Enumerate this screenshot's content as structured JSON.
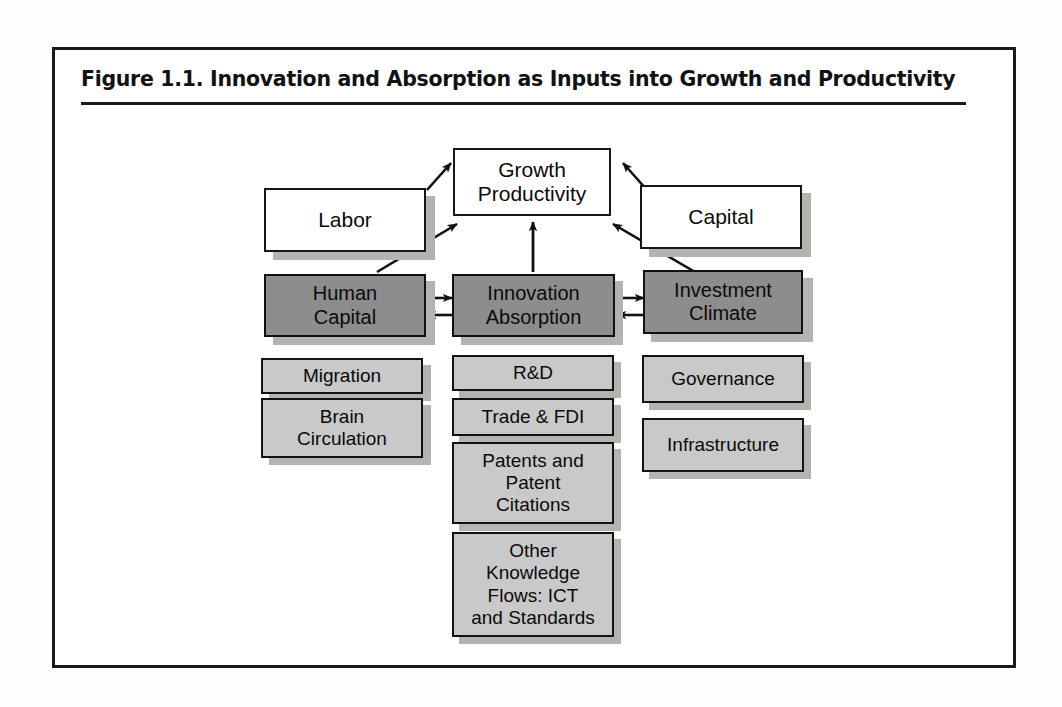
{
  "figure": {
    "title": "Figure 1.1.  Innovation and Absorption as Inputs into Growth and Productivity",
    "colors": {
      "frame_border": "#1a1a1a",
      "white_box_fill": "#ffffff",
      "dark_box_fill": "#8d8d8d",
      "light_box_fill": "#c9c9c9",
      "shadow": "#b4b3b0",
      "text": "#0a0a0a"
    }
  },
  "diagram": {
    "type": "flow-diagram",
    "top_nodes": [
      {
        "id": "labor",
        "label": "Labor",
        "style": "white"
      },
      {
        "id": "growth-productivity",
        "label": "Growth\nProductivity",
        "style": "white"
      },
      {
        "id": "capital",
        "label": "Capital",
        "style": "white"
      }
    ],
    "middle_nodes": [
      {
        "id": "human-capital",
        "label": "Human\nCapital",
        "style": "dark"
      },
      {
        "id": "innovation-absorption",
        "label": "Innovation\nAbsorption",
        "style": "dark"
      },
      {
        "id": "investment-climate",
        "label": "Investment\nClimate",
        "style": "dark"
      }
    ],
    "columns": [
      {
        "id": "human-capital-indicators",
        "items": [
          {
            "id": "migration",
            "label": "Migration",
            "style": "light"
          },
          {
            "id": "brain-circulation",
            "label": "Brain\nCirculation",
            "style": "light"
          }
        ]
      },
      {
        "id": "innovation-absorption-indicators",
        "items": [
          {
            "id": "rd",
            "label": "R&D",
            "style": "light"
          },
          {
            "id": "trade-fdi",
            "label": "Trade & FDI",
            "style": "light"
          },
          {
            "id": "patents-and-patent-citations",
            "label": "Patents and\nPatent\nCitations",
            "style": "light"
          },
          {
            "id": "other-knowledge-flows",
            "label": "Other\nKnowledge\nFlows: ICT\nand Standards",
            "style": "light"
          }
        ]
      },
      {
        "id": "investment-climate-indicators",
        "items": [
          {
            "id": "governance",
            "label": "Governance",
            "style": "light"
          },
          {
            "id": "infrastructure",
            "label": "Infrastructure",
            "style": "light"
          }
        ]
      }
    ],
    "arrows": [
      {
        "from": "labor",
        "to": "growth-productivity",
        "kind": "single"
      },
      {
        "from": "capital",
        "to": "growth-productivity",
        "kind": "single"
      },
      {
        "from": "human-capital",
        "to": "growth-productivity",
        "kind": "single"
      },
      {
        "from": "innovation-absorption",
        "to": "growth-productivity",
        "kind": "single"
      },
      {
        "from": "investment-climate",
        "to": "growth-productivity",
        "kind": "single"
      },
      {
        "from": "human-capital",
        "to": "innovation-absorption",
        "kind": "double"
      },
      {
        "from": "innovation-absorption",
        "to": "investment-climate",
        "kind": "double"
      }
    ]
  }
}
